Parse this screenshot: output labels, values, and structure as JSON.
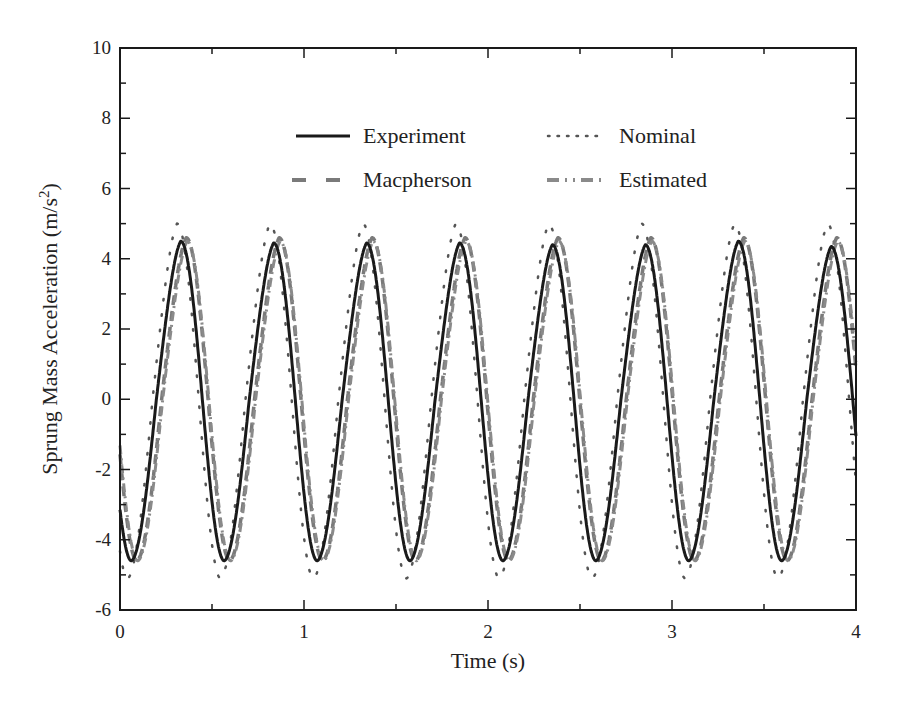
{
  "chart_data": {
    "type": "line",
    "title": "",
    "xlabel": "Time (s)",
    "ylabel": "Sprung Mass Acceleration (m/s²)",
    "xlim": [
      0,
      4
    ],
    "ylim": [
      -6,
      10
    ],
    "x_ticks": [
      "0",
      "1",
      "2",
      "3",
      "4"
    ],
    "y_ticks": [
      "-6",
      "-4",
      "-2",
      "0",
      "2",
      "4",
      "6",
      "8",
      "10"
    ],
    "grid": false,
    "legend_position": "upper center (inside plot, 2 columns)",
    "signal": {
      "frequency_hz": 1.98,
      "period_s": 0.505,
      "first_peak_time_s": 0.33
    },
    "series": [
      {
        "name": "Experiment",
        "style": "solid",
        "color": "#1a1a1a",
        "amplitude_peak": 4.45,
        "amplitude_trough": -4.6,
        "phase_offset_s": 0.0
      },
      {
        "name": "Nominal",
        "style": "dotted",
        "color": "#555555",
        "amplitude_peak": 5.0,
        "amplitude_trough": -5.1,
        "phase_offset_s": -0.02
      },
      {
        "name": "Macpherson",
        "style": "dashed",
        "color": "#7a7a7a",
        "amplitude_peak": 4.6,
        "amplitude_trough": -4.6,
        "phase_offset_s": 0.03
      },
      {
        "name": "Estimated",
        "style": "dash-dot",
        "color": "#8a8a8a",
        "amplitude_peak": 4.5,
        "amplitude_trough": -4.6,
        "phase_offset_s": 0.035
      }
    ],
    "peaks_experiment": [
      {
        "t": 0.33,
        "y": 4.5
      },
      {
        "t": 0.84,
        "y": 4.45
      },
      {
        "t": 1.35,
        "y": 4.45
      },
      {
        "t": 1.86,
        "y": 4.45
      },
      {
        "t": 2.36,
        "y": 4.4
      },
      {
        "t": 2.86,
        "y": 4.4
      },
      {
        "t": 3.36,
        "y": 4.5
      },
      {
        "t": 3.87,
        "y": 4.35
      }
    ],
    "troughs_experiment": [
      {
        "t": 0.06,
        "y": -4.6
      },
      {
        "t": 0.57,
        "y": -4.6
      },
      {
        "t": 1.08,
        "y": -4.6
      },
      {
        "t": 1.58,
        "y": -4.55
      },
      {
        "t": 2.08,
        "y": -4.6
      },
      {
        "t": 2.58,
        "y": -4.6
      },
      {
        "t": 3.08,
        "y": -4.65
      },
      {
        "t": 3.58,
        "y": -4.7
      }
    ]
  },
  "legend": {
    "items": [
      {
        "label": "Experiment"
      },
      {
        "label": "Nominal"
      },
      {
        "label": "Macpherson"
      },
      {
        "label": "Estimated"
      }
    ]
  },
  "axes": {
    "xlabel": "Time (s)",
    "ylabel_main": "Sprung Mass Acceleration (m/s",
    "ylabel_sup": "2",
    "ylabel_end": ")"
  }
}
